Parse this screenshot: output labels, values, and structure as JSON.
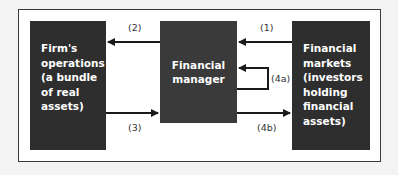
{
  "diagram": {
    "boxes": {
      "firm": {
        "label": "Firm's\noperations\n(a bundle\nof real\nassets)"
      },
      "manager": {
        "label": "Financial\nmanager"
      },
      "markets": {
        "label": "Financial\nmarkets\n(investors\nholding\nfinancial\nassets)"
      }
    },
    "arrows": [
      {
        "id": "1",
        "label": "(1)",
        "from": "markets",
        "to": "manager"
      },
      {
        "id": "2",
        "label": "(2)",
        "from": "manager",
        "to": "firm"
      },
      {
        "id": "3",
        "label": "(3)",
        "from": "firm",
        "to": "manager"
      },
      {
        "id": "4a",
        "label": "(4a)",
        "from": "manager",
        "to": "manager"
      },
      {
        "id": "4b",
        "label": "(4b)",
        "from": "manager",
        "to": "markets"
      }
    ]
  }
}
